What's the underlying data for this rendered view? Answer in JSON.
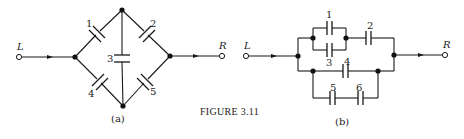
{
  "figure": {
    "caption_prefix": "Figure",
    "caption_number": "3.11",
    "caption": "FIGURE 3.11"
  },
  "diagram_a": {
    "sublabel": "(a)",
    "terminals": {
      "left": "L",
      "right": "R"
    },
    "capacitors": [
      {
        "id": "1",
        "label": "1",
        "between": [
          "left-node",
          "top-node"
        ]
      },
      {
        "id": "2",
        "label": "2",
        "between": [
          "top-node",
          "right-node"
        ]
      },
      {
        "id": "3",
        "label": "3",
        "between": [
          "top-node",
          "bottom-node"
        ]
      },
      {
        "id": "4",
        "label": "4",
        "between": [
          "left-node",
          "bottom-node"
        ]
      },
      {
        "id": "5",
        "label": "5",
        "between": [
          "bottom-node",
          "right-node"
        ]
      }
    ]
  },
  "diagram_b": {
    "sublabel": "(b)",
    "terminals": {
      "left": "L",
      "right": "R"
    },
    "capacitors": [
      {
        "id": "1",
        "label": "1",
        "group": "parallel with 3, upper branch"
      },
      {
        "id": "2",
        "label": "2",
        "group": "series after 1||3, upper branch"
      },
      {
        "id": "3",
        "label": "3",
        "group": "parallel with 1, upper branch"
      },
      {
        "id": "4",
        "label": "4",
        "group": "lower branch, parallel with 5-6 series"
      },
      {
        "id": "5",
        "label": "5",
        "group": "series with 6, bottom loop"
      },
      {
        "id": "6",
        "label": "6",
        "group": "series with 5, bottom loop"
      }
    ]
  },
  "colors": {
    "ink": "#1a1a1a",
    "background": "#ffffff"
  }
}
